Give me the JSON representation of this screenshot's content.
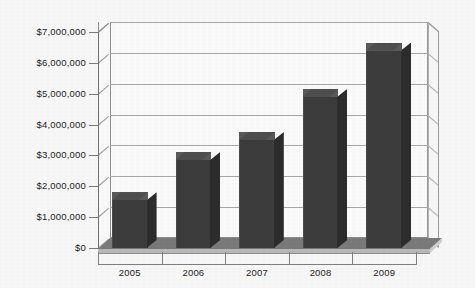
{
  "chart_data": {
    "type": "bar",
    "title": "",
    "subtitle": "",
    "xlabel": "",
    "ylabel": "",
    "categories": [
      "2005",
      "2006",
      "2007",
      "2008",
      "2009"
    ],
    "values": [
      1550000,
      2850000,
      3500000,
      4900000,
      6400000
    ],
    "series": [
      {
        "name": "",
        "values": [
          1550000,
          2850000,
          3500000,
          4900000,
          6400000
        ]
      }
    ],
    "ylim": [
      0,
      7000000
    ],
    "ytick_values": [
      0,
      1000000,
      2000000,
      3000000,
      4000000,
      5000000,
      6000000,
      7000000
    ],
    "ytick_labels": [
      "$0",
      "$1,000,000",
      "$2,000,000",
      "$3,000,000",
      "$4,000,000",
      "$5,000,000",
      "$6,000,000",
      "$7,000,000"
    ],
    "grid": true,
    "legend": false,
    "legend_position": "none",
    "three_d": true,
    "bar_color": "#3c3c3c",
    "bar_top_color": "#4e4e4e",
    "bar_side_color": "#2c2c2c",
    "gridline_color": "#a8a8a8",
    "plot_background": "#fbfbfb",
    "page_background": "#f8f8f8",
    "floor_color": "#7a7a7a",
    "text_color": "#1c1c1c",
    "annotations": []
  }
}
